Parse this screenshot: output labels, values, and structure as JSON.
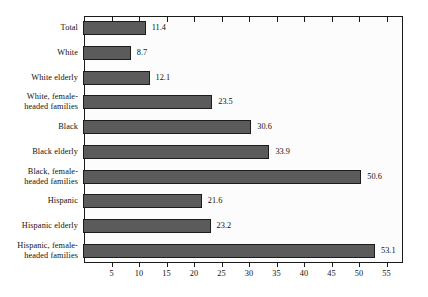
{
  "chart_data": {
    "type": "bar",
    "orientation": "horizontal",
    "title": "",
    "subtitle": "",
    "xlabel": "",
    "ylabel": "",
    "categories": [
      "Total",
      "White",
      "White elderly",
      "White, female-headed families",
      "Black",
      "Black elderly",
      "Black, female-headed families",
      "Hispanic",
      "Hispanic elderly",
      "Hispanic, female-headed families"
    ],
    "values": [
      11.4,
      8.7,
      12.1,
      23.5,
      30.6,
      33.9,
      50.6,
      21.6,
      23.2,
      53.1
    ],
    "value_labels": [
      "11.4",
      "8.7",
      "12.1",
      "23.5",
      "30.6",
      "33.9",
      "50.6",
      "21.6",
      "23.2",
      "53.1"
    ],
    "xlim": [
      0,
      58
    ],
    "xticks": [
      5,
      10,
      15,
      20,
      25,
      30,
      35,
      40,
      45,
      50,
      55
    ],
    "xtick_labels": [
      "5",
      "10",
      "15",
      "20",
      "25",
      "30",
      "35",
      "40",
      "45",
      "50",
      "55"
    ],
    "grid": false,
    "legend": null,
    "bar_color": "#5b5b5b",
    "bar_border_color": "#1c1c1c",
    "plot_background": "#fcfcfc",
    "axis_color": "#1a1a1a",
    "text_color": "#111111"
  },
  "category_label_lines": [
    [
      "Total"
    ],
    [
      "White"
    ],
    [
      "White elderly"
    ],
    [
      "White, female-",
      "headed families"
    ],
    [
      "Black"
    ],
    [
      "Black elderly"
    ],
    [
      "Black, female-",
      "headed families"
    ],
    [
      "Hispanic"
    ],
    [
      "Hispanic elderly"
    ],
    [
      "Hispanic, female-",
      "headed families"
    ]
  ]
}
